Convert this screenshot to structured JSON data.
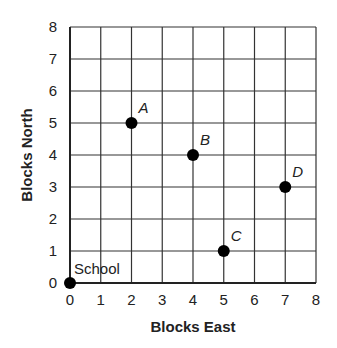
{
  "chart_data": {
    "type": "scatter",
    "title": "",
    "xlabel": "Blocks East",
    "ylabel": "Blocks North",
    "xlim": [
      0,
      8
    ],
    "ylim": [
      0,
      8
    ],
    "grid": true,
    "x_ticks": [
      "0",
      "1",
      "2",
      "3",
      "4",
      "5",
      "6",
      "7",
      "8"
    ],
    "y_ticks": [
      "0",
      "1",
      "2",
      "3",
      "4",
      "5",
      "6",
      "7",
      "8"
    ],
    "points": [
      {
        "label": "School",
        "x": 0,
        "y": 0,
        "italic": false
      },
      {
        "label": "A",
        "x": 2,
        "y": 5,
        "italic": true
      },
      {
        "label": "B",
        "x": 4,
        "y": 4,
        "italic": true
      },
      {
        "label": "C",
        "x": 5,
        "y": 1,
        "italic": true
      },
      {
        "label": "D",
        "x": 7,
        "y": 3,
        "italic": true
      }
    ]
  },
  "colors": {
    "grid": "#333333",
    "axis": "#222222",
    "point": "#000000"
  }
}
